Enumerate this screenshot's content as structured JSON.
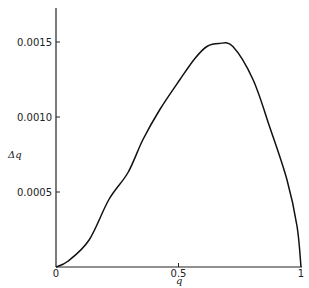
{
  "chart_data": {
    "type": "line",
    "title": "",
    "xlabel": "q",
    "ylabel": "Δq",
    "xlim": [
      0,
      1
    ],
    "ylim": [
      0,
      0.00173
    ],
    "grid": false,
    "legend": null,
    "x_ticks": [
      {
        "value": 0,
        "label": "0"
      },
      {
        "value": 0.5,
        "label": "0.5"
      },
      {
        "value": 1,
        "label": "1"
      }
    ],
    "y_ticks": [
      {
        "value": 0.0005,
        "label": "0.0005"
      },
      {
        "value": 0.001,
        "label": "0.0010"
      },
      {
        "value": 0.0015,
        "label": "0.0015"
      }
    ],
    "series": [
      {
        "name": "Δq",
        "x": [
          0,
          0.05,
          0.135,
          0.216,
          0.294,
          0.355,
          0.424,
          0.506,
          0.567,
          0.616,
          0.665,
          0.722,
          0.804,
          0.873,
          0.943,
          0.984,
          1.0
        ],
        "values": [
          0,
          4e-05,
          0.00018,
          0.00045,
          0.00063,
          0.00085,
          0.00105,
          0.00125,
          0.00139,
          0.00147,
          0.00149,
          0.00147,
          0.00125,
          0.00093,
          0.00058,
          0.00027,
          0
        ]
      }
    ]
  }
}
